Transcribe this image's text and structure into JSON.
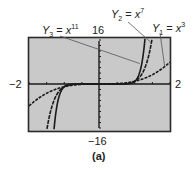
{
  "figure": {
    "caption": "(a)",
    "colors": {
      "screen": "#c9c9c9",
      "frame": "#2a2a2a",
      "curve": "#1a1a1a",
      "leader": "#555555"
    }
  },
  "window": {
    "xmin_label": "−2",
    "xmax_label": "2",
    "ymax_label": "16",
    "ymin_label": "−16"
  },
  "labels": {
    "y1": {
      "name": "Y",
      "sub": "1",
      "eq": " = ",
      "var": "x",
      "exp": "3"
    },
    "y2": {
      "name": "Y",
      "sub": "2",
      "eq": " = ",
      "var": "x",
      "exp": "7"
    },
    "y3": {
      "name": "Y",
      "sub": "3",
      "eq": " = ",
      "var": "x",
      "exp": "11"
    }
  },
  "chart_data": {
    "type": "line",
    "title": "",
    "xlabel": "",
    "ylabel": "",
    "xlim": [
      -2,
      2
    ],
    "ylim": [
      -16,
      16
    ],
    "grid": false,
    "axis_ticks": {
      "x_step": 0.5,
      "y_step": 2
    },
    "legend": "leader-line annotations",
    "series": [
      {
        "name": "Y1 = x^3",
        "function": "x^3",
        "x": [
          -2,
          -1.5,
          -1,
          -0.5,
          0,
          0.5,
          1,
          1.5,
          2
        ],
        "y": [
          -8,
          -3.375,
          -1,
          -0.125,
          0,
          0.125,
          1,
          3.375,
          8
        ]
      },
      {
        "name": "Y2 = x^7",
        "function": "x^7",
        "x": [
          -1.486,
          -1.3,
          -1,
          -0.5,
          0,
          0.5,
          1,
          1.3,
          1.486
        ],
        "y": [
          -16,
          -6.27,
          -1,
          -0.0078,
          0,
          0.0078,
          1,
          6.27,
          16
        ]
      },
      {
        "name": "Y3 = x^11",
        "function": "x^11",
        "x": [
          -1.287,
          -1.2,
          -1,
          -0.5,
          0,
          0.5,
          1,
          1.2,
          1.287
        ],
        "y": [
          -16,
          -7.43,
          -1,
          -0.0005,
          0,
          0.0005,
          1,
          7.43,
          16
        ]
      }
    ],
    "annotations": [
      "Y3 = x^11",
      "Y2 = x^7",
      "Y1 = x^3",
      "16",
      "-16",
      "-2",
      "2",
      "(a)"
    ]
  }
}
